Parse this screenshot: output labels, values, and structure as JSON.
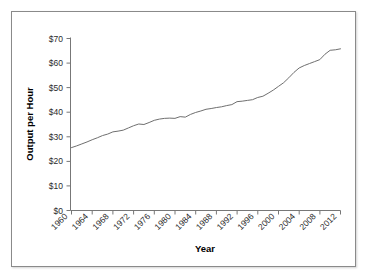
{
  "chart_data": {
    "type": "line",
    "title": "",
    "xlabel": "Year",
    "ylabel": "Output per Hour",
    "xlim": [
      1960,
      2012
    ],
    "ylim": [
      0,
      70
    ],
    "grid": false,
    "legend": null,
    "y_tick_labels": [
      "$0",
      "$10",
      "$20",
      "$30",
      "$40",
      "$50",
      "$60",
      "$70"
    ],
    "y_ticks": [
      0,
      10,
      20,
      30,
      40,
      50,
      60,
      70
    ],
    "x_tick_labels": [
      "1960",
      "1964",
      "1968",
      "1972",
      "1976",
      "1980",
      "1984",
      "1988",
      "1992",
      "1996",
      "2000",
      "2004",
      "2008",
      "2012"
    ],
    "x_ticks": [
      1960,
      1964,
      1968,
      1972,
      1976,
      1980,
      1984,
      1988,
      1992,
      1996,
      2000,
      2004,
      2008,
      2012
    ],
    "x": [
      1960,
      1961,
      1962,
      1963,
      1964,
      1965,
      1966,
      1967,
      1968,
      1969,
      1970,
      1971,
      1972,
      1973,
      1974,
      1975,
      1976,
      1977,
      1978,
      1979,
      1980,
      1981,
      1982,
      1983,
      1984,
      1985,
      1986,
      1987,
      1988,
      1989,
      1990,
      1991,
      1992,
      1993,
      1994,
      1995,
      1996,
      1997,
      1998,
      1999,
      2000,
      2001,
      2002,
      2003,
      2004,
      2005,
      2006,
      2007,
      2008,
      2009,
      2010,
      2011,
      2012
    ],
    "values": [
      25.6,
      26.3,
      27.1,
      27.9,
      28.8,
      29.6,
      30.5,
      31.1,
      32.0,
      32.3,
      32.7,
      33.6,
      34.5,
      35.2,
      35.0,
      35.8,
      36.7,
      37.2,
      37.5,
      37.6,
      37.5,
      38.2,
      38.0,
      39.1,
      39.9,
      40.5,
      41.2,
      41.5,
      41.9,
      42.2,
      42.7,
      43.1,
      44.3,
      44.5,
      44.8,
      45.1,
      46.0,
      46.5,
      47.7,
      49.0,
      50.5,
      52.0,
      54.0,
      56.2,
      58.0,
      59.0,
      59.8,
      60.6,
      61.4,
      63.6,
      65.2,
      65.4,
      65.8
    ],
    "line_color": "#6f6f6f",
    "series_name": "Output per Hour"
  },
  "axes": {
    "y_title": "Output per Hour",
    "x_title": "Year"
  }
}
